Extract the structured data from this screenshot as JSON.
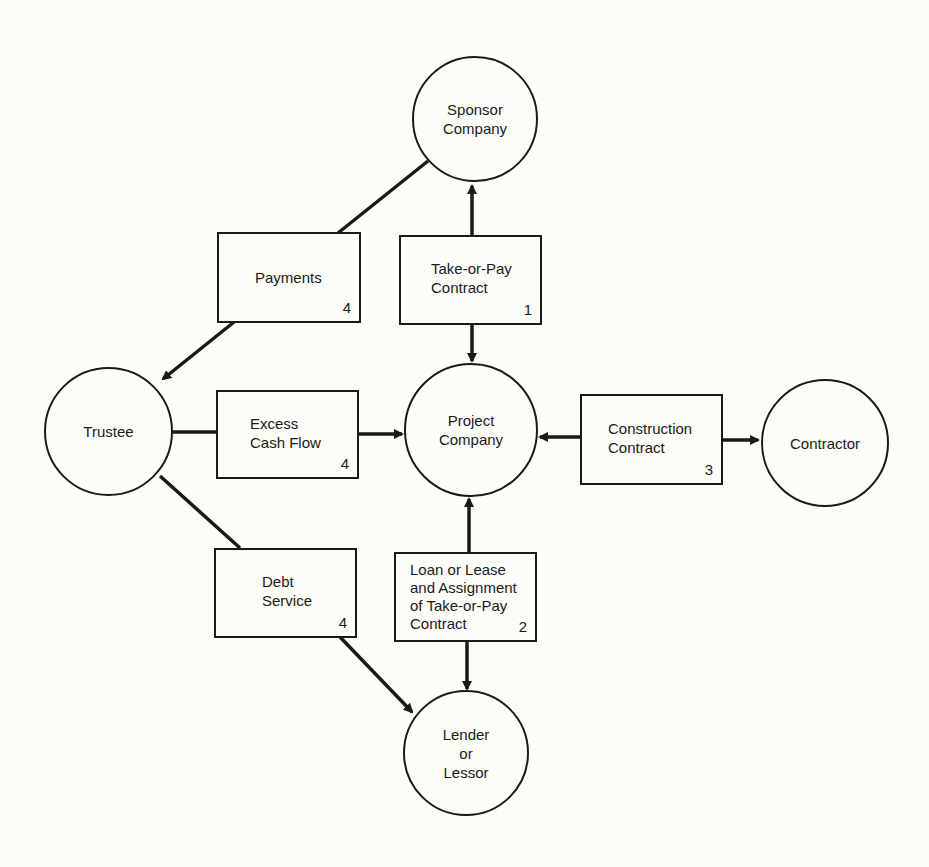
{
  "diagram": {
    "type": "project-finance-structure",
    "nodes": {
      "sponsor": {
        "label": "Sponsor\nCompany"
      },
      "trustee": {
        "label": "Trustee"
      },
      "project": {
        "label": "Project\nCompany"
      },
      "contractor": {
        "label": "Contractor"
      },
      "lender": {
        "label": "Lender\nor\nLessor"
      }
    },
    "boxes": {
      "payments": {
        "label": "Payments",
        "number": "4"
      },
      "take_or_pay": {
        "label": "Take-or-Pay\nContract",
        "number": "1"
      },
      "excess_cash": {
        "label": "Excess\nCash Flow",
        "number": "4"
      },
      "construction": {
        "label": "Construction\nContract",
        "number": "3"
      },
      "debt_service": {
        "label": "Debt\nService",
        "number": "4"
      },
      "loan": {
        "label": "Loan or Lease\nand Assignment\nof Take-or-Pay\nContract",
        "number": "2"
      }
    },
    "edges": [
      {
        "from": "sponsor",
        "via": "payments",
        "to": "trustee",
        "arrow": "to"
      },
      {
        "from": "take_or_pay",
        "to": "sponsor",
        "arrow": "to"
      },
      {
        "from": "take_or_pay",
        "to": "project",
        "arrow": "to"
      },
      {
        "from": "trustee",
        "via": "excess_cash",
        "to": "project",
        "arrow": "to"
      },
      {
        "from": "construction",
        "to": "project",
        "arrow": "to"
      },
      {
        "from": "construction",
        "to": "contractor",
        "arrow": "to"
      },
      {
        "from": "loan",
        "to": "project",
        "arrow": "to"
      },
      {
        "from": "loan",
        "to": "lender",
        "arrow": "to"
      },
      {
        "from": "trustee",
        "via": "debt_service",
        "to": "lender",
        "arrow": "to"
      }
    ],
    "colors": {
      "ink": "#1a1a1a",
      "paper": "#fdfdf8"
    }
  }
}
